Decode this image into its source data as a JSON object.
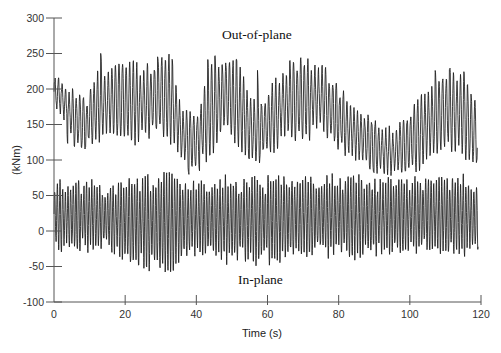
{
  "chart_data": {
    "type": "line",
    "title": "",
    "xlabel": "Time (s)",
    "ylabel": "(kNm)",
    "xlim": [
      0,
      120
    ],
    "ylim": [
      -100,
      300
    ],
    "xticks": [
      0,
      20,
      40,
      60,
      80,
      100,
      120
    ],
    "yticks": [
      -100,
      -50,
      0,
      50,
      100,
      150,
      200,
      250,
      300
    ],
    "grid": false,
    "legend": null,
    "annotations": [
      {
        "text": "Out-of-plane",
        "x": 57,
        "y": 270
      },
      {
        "text": "In-plane",
        "x": 58,
        "y": -75
      }
    ],
    "series": [
      {
        "name": "Out-of-plane",
        "description": "Oscillating bending moment, approx. 1 Hz, mean ~150-190 kNm, range ~75-265 kNm",
        "oscillation_period_s": 1.0,
        "envelope": {
          "t": [
            0,
            2,
            5,
            9,
            12,
            18,
            25,
            30,
            33,
            36,
            40,
            44,
            48,
            52,
            56,
            60,
            65,
            70,
            75,
            78,
            84,
            90,
            95,
            100,
            105,
            110,
            115,
            118
          ],
          "center": [
            195,
            190,
            160,
            150,
            175,
            185,
            180,
            190,
            185,
            135,
            125,
            170,
            195,
            175,
            140,
            150,
            180,
            185,
            190,
            170,
            140,
            120,
            110,
            125,
            150,
            170,
            165,
            140
          ],
          "amp": [
            20,
            22,
            35,
            35,
            45,
            50,
            50,
            55,
            55,
            45,
            40,
            55,
            60,
            55,
            45,
            45,
            50,
            55,
            50,
            45,
            40,
            35,
            30,
            40,
            55,
            60,
            55,
            45
          ]
        },
        "peaks": [
          {
            "t": 13,
            "v": 265
          },
          {
            "t": 29,
            "v": 255
          },
          {
            "t": 33,
            "v": 255
          },
          {
            "t": 43,
            "v": 265
          },
          {
            "t": 45,
            "v": 262
          },
          {
            "t": 51,
            "v": 255
          },
          {
            "t": 57,
            "v": 250
          },
          {
            "t": 66,
            "v": 255
          },
          {
            "t": 69,
            "v": 255
          },
          {
            "t": 107,
            "v": 232
          },
          {
            "t": 111,
            "v": 235
          }
        ],
        "troughs": [
          {
            "t": 4,
            "v": 110
          },
          {
            "t": 38,
            "v": 75
          },
          {
            "t": 41,
            "v": 80
          },
          {
            "t": 55,
            "v": 95
          },
          {
            "t": 90,
            "v": 80
          },
          {
            "t": 93,
            "v": 75
          }
        ]
      },
      {
        "name": "In-plane",
        "description": "Oscillating bending moment, approx. 1 Hz, mean ~15 kNm, range ~-50 to ~80 kNm",
        "oscillation_period_s": 0.75,
        "envelope": {
          "t": [
            0,
            5,
            10,
            15,
            20,
            25,
            30,
            35,
            40,
            45,
            50,
            55,
            60,
            65,
            70,
            75,
            80,
            85,
            90,
            95,
            100,
            105,
            110,
            115,
            119
          ],
          "center": [
            22,
            20,
            22,
            18,
            15,
            12,
            12,
            14,
            18,
            16,
            16,
            16,
            15,
            18,
            20,
            22,
            22,
            20,
            20,
            22,
            22,
            24,
            22,
            22,
            18
          ],
          "amp": [
            45,
            48,
            42,
            42,
            55,
            62,
            64,
            58,
            50,
            55,
            55,
            55,
            58,
            52,
            50,
            50,
            52,
            52,
            50,
            48,
            48,
            48,
            50,
            50,
            48
          ]
        }
      }
    ]
  }
}
